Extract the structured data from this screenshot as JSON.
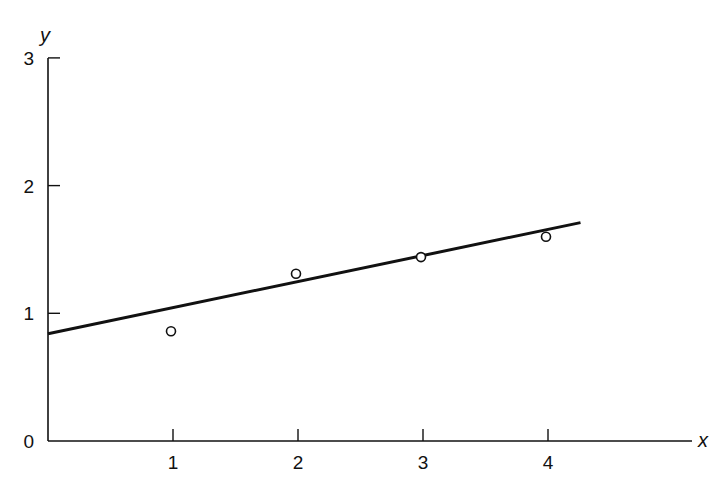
{
  "chart_data": {
    "type": "scatter",
    "title": "",
    "xlabel": "x",
    "ylabel": "y",
    "xlim": [
      0,
      5.2
    ],
    "ylim": [
      0,
      3
    ],
    "x_ticks": [
      1,
      2,
      3,
      4
    ],
    "y_ticks": [
      0,
      1,
      2,
      3
    ],
    "x_tick_labels": [
      "1",
      "2",
      "3",
      "4"
    ],
    "y_tick_labels": [
      "0",
      "1",
      "2",
      "3"
    ],
    "grid": false,
    "legend": null,
    "series": [
      {
        "name": "data points",
        "type": "scatter",
        "marker": "open-circle",
        "x": [
          1,
          2,
          3,
          4
        ],
        "y": [
          0.86,
          1.31,
          1.44,
          1.6
        ]
      },
      {
        "name": "fitted line",
        "type": "line",
        "x": [
          0,
          4.26
        ],
        "y": [
          0.84,
          1.71
        ]
      }
    ],
    "colors": {
      "ink": "#111111",
      "background": "#ffffff"
    }
  },
  "labels": {
    "x_axis": "x",
    "y_axis": "y",
    "origin": "0"
  }
}
